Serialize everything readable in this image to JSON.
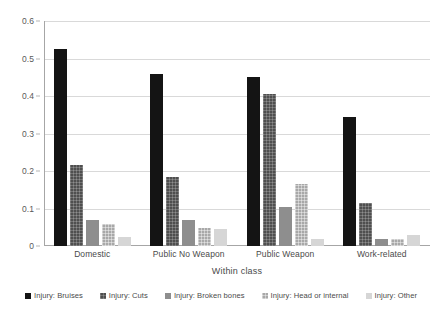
{
  "chart_data": {
    "type": "bar",
    "title": "",
    "xlabel": "Within class",
    "ylabel": "Probability",
    "ylim": [
      0,
      0.6
    ],
    "yticks": [
      "0",
      "0.1",
      "0.2",
      "0.3",
      "0.4",
      "0.5",
      "0.6"
    ],
    "ytick_values": [
      0,
      0.1,
      0.2,
      0.3,
      0.4,
      0.5,
      0.6
    ],
    "grid": true,
    "legend_position": "bottom",
    "categories": [
      "Domestic",
      "Public No Weapon",
      "Public Weapon",
      "Work-related"
    ],
    "series": [
      {
        "name": "Injury: Bruises",
        "color": "#141414",
        "values": [
          0.525,
          0.458,
          0.45,
          0.345
        ]
      },
      {
        "name": "Injury: Cuts",
        "color": "#4f4f4f",
        "values": [
          0.215,
          0.183,
          0.405,
          0.115
        ]
      },
      {
        "name": "Injury: Broken bones",
        "color": "#8e8e8e",
        "values": [
          0.07,
          0.07,
          0.105,
          0.02
        ]
      },
      {
        "name": "Injury: Head or internal",
        "color": "#a8a8a8",
        "values": [
          0.06,
          0.048,
          0.165,
          0.02
        ]
      },
      {
        "name": "Injury: Other",
        "color": "#d6d6d6",
        "values": [
          0.025,
          0.045,
          0.02,
          0.03
        ]
      }
    ]
  }
}
